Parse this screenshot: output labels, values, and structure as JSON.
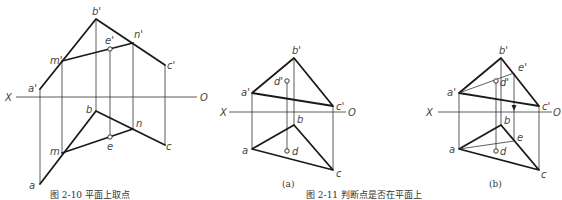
{
  "figures": [
    {
      "id": "fig-2-10",
      "caption": "图 2-10  平面上取点",
      "axis_left": "X",
      "axis_right": "",
      "labels": {
        "b_prime": "b'",
        "m_prime": "m'",
        "a_prime": "a'",
        "e_prime": "e'",
        "n_prime": "n'",
        "c_prime": "c'",
        "b": "b",
        "n": "n",
        "c": "c",
        "e": "e",
        "m": "m",
        "a": "a"
      }
    },
    {
      "id": "fig-2-11a",
      "sub_caption": "(a)",
      "axis_left": "X",
      "axis_right": "O",
      "labels": {
        "b_prime": "b'",
        "a_prime": "a'",
        "c_prime": "c'",
        "d_prime": "d'",
        "b": "b",
        "a": "a",
        "c": "c",
        "d": "d"
      }
    },
    {
      "id": "fig-2-11b",
      "sub_caption": "(b)",
      "axis_left": "X",
      "axis_right": "O",
      "labels": {
        "b_prime": "b'",
        "a_prime": "a'",
        "c_prime": "c'",
        "d_prime": "d'",
        "e_prime": "e'",
        "b": "b",
        "a": "a",
        "c": "c",
        "d": "d",
        "e": "e"
      }
    }
  ],
  "captions": {
    "left": "图 2-10  平面上取点",
    "right": "图 2-11  判断点是否在平面上"
  },
  "extra_axis_label": "O"
}
